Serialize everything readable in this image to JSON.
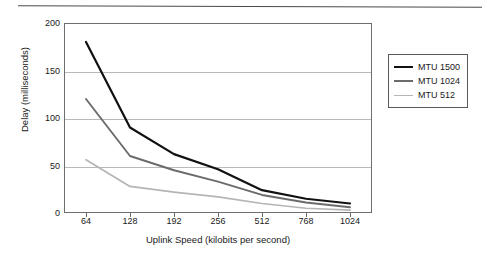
{
  "chart_data": {
    "type": "line",
    "title": "",
    "xlabel": "Uplink Speed (kilobits per second)",
    "ylabel": "Delay (milliseconds)",
    "categories": [
      "64",
      "128",
      "192",
      "256",
      "512",
      "768",
      "1024"
    ],
    "x_tick_labels": [
      "64",
      "128",
      "192",
      "256",
      "512",
      "768",
      "1024"
    ],
    "y_tick_labels": [
      "0",
      "50",
      "100",
      "150",
      "200"
    ],
    "y_ticks": [
      0,
      50,
      100,
      150,
      200
    ],
    "ylim": [
      0,
      200
    ],
    "grid": "horizontal",
    "legend_position": "right-outside",
    "series": [
      {
        "name": "MTU 1500",
        "color": "#111111",
        "values": [
          180,
          90,
          62,
          46,
          24,
          15,
          10
        ]
      },
      {
        "name": "MTU 1024",
        "color": "#6b6b6b",
        "values": [
          120,
          60,
          45,
          33,
          19,
          11,
          6
        ]
      },
      {
        "name": "MTU 512",
        "color": "#b5b5b5",
        "values": [
          56,
          28,
          22,
          17,
          10,
          5,
          3
        ]
      }
    ]
  },
  "legend": {
    "entries": [
      {
        "label": "MTU 1500",
        "color": "#111111"
      },
      {
        "label": "MTU 1024",
        "color": "#6b6b6b"
      },
      {
        "label": "MTU 512",
        "color": "#b5b5b5"
      }
    ]
  },
  "colors": {
    "axis": "#6e6e6e",
    "grid": "#b9b9b9",
    "text": "#1a1a1a",
    "background": "#ffffff"
  }
}
